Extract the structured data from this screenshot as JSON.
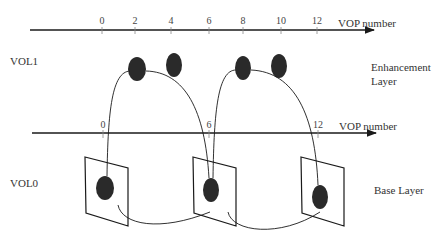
{
  "diagram": {
    "top_axis": {
      "label": "VOP number",
      "ticks": [
        {
          "value": "0",
          "x": 102
        },
        {
          "value": "2",
          "x": 135
        },
        {
          "value": "4",
          "x": 171
        },
        {
          "value": "6",
          "x": 209
        },
        {
          "value": "8",
          "x": 243
        },
        {
          "value": "10",
          "x": 281
        },
        {
          "value": "12",
          "x": 317
        }
      ]
    },
    "bottom_axis": {
      "label": "VOP number",
      "ticks": [
        {
          "value": "0",
          "x": 103
        },
        {
          "value": "6",
          "x": 209
        },
        {
          "value": "12",
          "x": 318
        }
      ]
    },
    "layers": {
      "vol1": {
        "name": "VOL1",
        "description_line1": "Enhancement",
        "description_line2": "Layer"
      },
      "vol0": {
        "name": "VOL0",
        "description": "Base Layer"
      }
    },
    "enhancement_vops": [
      2,
      4,
      8,
      10
    ],
    "base_vops": [
      0,
      6,
      12
    ],
    "colors": {
      "ink": "#1a1a1a",
      "blob": "#2a2a2a",
      "background": "#ffffff"
    }
  }
}
